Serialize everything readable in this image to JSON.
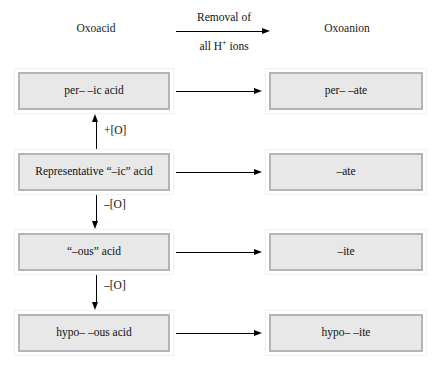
{
  "header": {
    "left_label": "Oxoacid",
    "right_label": "Oxoanion",
    "arrow_label_top": "Removal of",
    "arrow_label_bottom_pre": "all H",
    "arrow_label_bottom_sup": "+",
    "arrow_label_bottom_post": " ions"
  },
  "rows": [
    {
      "acid": "per– –ic acid",
      "anion": "per– –ate"
    },
    {
      "acid": "Representative “–ic” acid",
      "anion": "–ate"
    },
    {
      "acid": "“–ous” acid",
      "anion": "–ite"
    },
    {
      "acid": "hypo– –ous acid",
      "anion": "hypo– –ite"
    }
  ],
  "vertical_steps": [
    {
      "label": "+[O]"
    },
    {
      "label": "–[O]"
    },
    {
      "label": "–[O]"
    }
  ],
  "colors": {
    "box_fill": "#e8e8e8",
    "box_inner_border": "#b4b4b4",
    "box_outer_border": "#f0f0f0",
    "arrow": "#000000",
    "text": "#111111",
    "background": "#ffffff"
  },
  "chart_data": {
    "type": "diagram",
    "columns": [
      "Oxoacid",
      "Oxoanion"
    ],
    "horizontal_transform": "Removal of all H+ ions",
    "nodes": [
      {
        "level": 1,
        "acid": "per– –ic acid",
        "anion": "per– –ate"
      },
      {
        "level": 2,
        "acid": "Representative “–ic” acid",
        "anion": "–ate"
      },
      {
        "level": 3,
        "acid": "“–ous” acid",
        "anion": "–ite"
      },
      {
        "level": 4,
        "acid": "hypo– –ous acid",
        "anion": "hypo– –ite"
      }
    ],
    "vertical_edges": [
      {
        "from_level": 2,
        "to_level": 1,
        "label": "+[O]",
        "direction": "up"
      },
      {
        "from_level": 2,
        "to_level": 3,
        "label": "–[O]",
        "direction": "down"
      },
      {
        "from_level": 3,
        "to_level": 4,
        "label": "–[O]",
        "direction": "down"
      }
    ],
    "horizontal_edges": [
      {
        "level": 1,
        "label": "Removal of all H+ ions"
      },
      {
        "level": 2,
        "label": "Removal of all H+ ions"
      },
      {
        "level": 3,
        "label": "Removal of all H+ ions"
      },
      {
        "level": 4,
        "label": "Removal of all H+ ions"
      }
    ]
  }
}
